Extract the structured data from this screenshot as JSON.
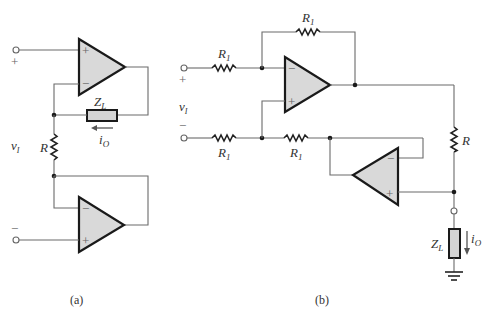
{
  "figure": {
    "panels": [
      {
        "id": "a",
        "caption": "(a)",
        "input_plus_sign": "+",
        "input_minus_sign": "−",
        "input_voltage_label": "v",
        "input_voltage_sub": "I",
        "resistor_label": "R",
        "load_label": "Z",
        "load_sub": "L",
        "current_label": "i",
        "current_sub": "O",
        "opamps": [
          {
            "name": "top",
            "plus": "+",
            "minus": "−"
          },
          {
            "name": "bottom",
            "plus": "+",
            "minus": "−"
          }
        ]
      },
      {
        "id": "b",
        "caption": "(b)",
        "input_plus_sign": "+",
        "input_minus_sign": "−",
        "input_voltage_label": "v",
        "input_voltage_sub": "I",
        "resistors": [
          {
            "position": "feedback",
            "label": "R",
            "sub": "1"
          },
          {
            "position": "input-top",
            "label": "R",
            "sub": "1"
          },
          {
            "position": "input-bottom",
            "label": "R",
            "sub": "1"
          },
          {
            "position": "series-bottom",
            "label": "R",
            "sub": "1"
          },
          {
            "position": "output-sense",
            "label": "R",
            "sub": ""
          }
        ],
        "load_label": "Z",
        "load_sub": "L",
        "current_label": "i",
        "current_sub": "O",
        "opamps": [
          {
            "name": "main",
            "plus": "+",
            "minus": "−"
          },
          {
            "name": "buffer",
            "plus": "+",
            "minus": "−"
          }
        ]
      }
    ]
  }
}
